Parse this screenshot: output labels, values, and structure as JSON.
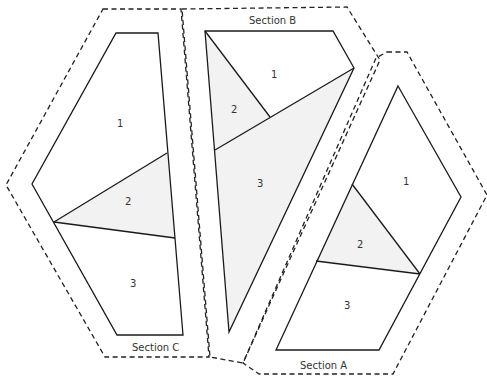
{
  "diagram": {
    "colors": {
      "line": "#1a1a1a",
      "shaded_piece": "#f2f2f2",
      "background": "#ffffff"
    },
    "sections": [
      {
        "name": "Section A",
        "label": "Section A",
        "pieces": [
          {
            "number": "1",
            "shaded": false
          },
          {
            "number": "2",
            "shaded": true
          },
          {
            "number": "3",
            "shaded": false
          }
        ]
      },
      {
        "name": "Section B",
        "label": "Section B",
        "pieces": [
          {
            "number": "1",
            "shaded": false
          },
          {
            "number": "2",
            "shaded": true
          },
          {
            "number": "3",
            "shaded": true
          }
        ]
      },
      {
        "name": "Section C",
        "label": "Section C",
        "pieces": [
          {
            "number": "1",
            "shaded": false
          },
          {
            "number": "2",
            "shaded": true
          },
          {
            "number": "3",
            "shaded": false
          }
        ]
      }
    ]
  }
}
